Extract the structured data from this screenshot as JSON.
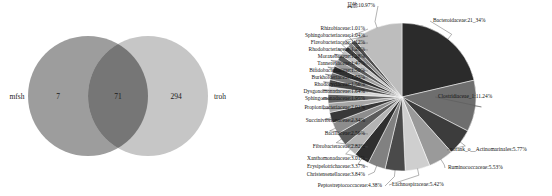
{
  "venn": {
    "left_set_label": "mfsh",
    "right_set_label": "troh",
    "left_only": "7",
    "intersection": "71",
    "right_only": "294",
    "caption": "",
    "left_circle_color": "#9d9d9d",
    "right_circle_color": "#c6c6c6",
    "overlap_color": "#767676"
  },
  "chart_data": {
    "type": "pie",
    "title": "",
    "units": "percent",
    "start_angle_deg": 0,
    "direction": "clockwise",
    "labels": [
      "Bacteroidaceae",
      "Clostridiaceae_1",
      "norank_o__Actinomarinales",
      "Ruminococcaceae",
      "Lachnospiraceae",
      "Peptostreptococcaceae",
      "Christensenellaceae",
      "Erysipelotrichaceae",
      "Xanthomonadaceae",
      "Fibrobacteraceae",
      "Bacillaceae",
      "Succinivibrionaceae",
      "Propionibacteriaceae",
      "Sphingomonadaceae",
      "Dysgonomonadaceae",
      "Rhodocyclaceae",
      "Burkholderiaceae",
      "Bifidobacteriaceae",
      "Tannerellaceae",
      "Moraxellaceae",
      "Rhodobacteriaceae",
      "Flavobacteriaceae",
      "Sphingobacteriaceae",
      "Rhizobiaceae",
      "其他"
    ],
    "values": [
      21.34,
      11.24,
      5.77,
      5.53,
      5.42,
      4.38,
      3.84,
      3.37,
      3.01,
      2.82,
      2.56,
      2.34,
      2.01,
      1.95,
      1.64,
      1.56,
      1.55,
      1.5,
      1.47,
      1.28,
      1.25,
      1.12,
      1.04,
      1.01,
      10.97
    ],
    "label_texts": [
      "Bacteroidaceae:21_34%",
      "Clostridiaceae_1:11.24%",
      "norank_o__Actinomarinales:5.77%",
      "Ruminococcaceae:5.53%",
      "Lachnospiraceae:5.42%",
      "Peptostreptococcaceae:4.38%",
      "Christensenellaceae:3.84%",
      "Erysipelotrichaceae:3.37%",
      "Xanthomonadaceae:3.01%",
      "Fibrobacteraceae:2.82%",
      "Bacillaceae:2.56%",
      "Succinivibrionaceae:2.34%",
      "Propionibacteriaceae:2.01%",
      "Sphingomonadaceae:1.95%",
      "Dysgonomonadaceae:1.64%",
      "Rhodocyclaceae:1.56%",
      "Burkholderiaceae:1.55%",
      "Bifidobacteriaceae:1.50%",
      "Tannerellaceae:1.47%",
      "Moraxellaceae:1.28%",
      "Rhodobacteriaceae:1.25%",
      "Flavobacteriaceae:1.12%",
      "Sphingobacteriaceae:1.04%",
      "Rhizobiaceae:1.01%",
      "其他:10.97%"
    ],
    "colors": [
      "#2b2b2b",
      "#6e6e6e",
      "#3c3c3c",
      "#9a9a9a",
      "#cfcfcf",
      "#4a4a4a",
      "#818181",
      "#2f2f2f",
      "#b4b4b4",
      "#5c5c5c",
      "#8d8d8d",
      "#383838",
      "#a6a6a6",
      "#636363",
      "#d6d6d6",
      "#454545",
      "#777777",
      "#303030",
      "#9e9e9e",
      "#5a5a5a",
      "#c2c2c2",
      "#3f3f3f",
      "#868686",
      "#4e4e4e",
      "#bdbdbd"
    ],
    "legend": "none",
    "grid": false
  }
}
